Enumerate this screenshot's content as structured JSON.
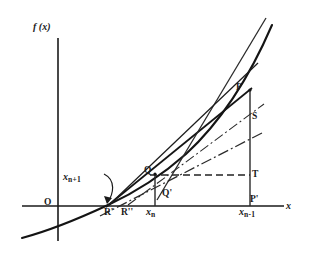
{
  "figure": {
    "type": "mathematical-diagram",
    "axes": {
      "y_axis_label": "f (x)",
      "x_axis_label": "x",
      "origin_label": "O"
    },
    "colors": {
      "ink": "#1a1a1a",
      "background": "#ffffff",
      "curve": "#141414",
      "construction": "#3a3a3a"
    },
    "point_labels": [
      {
        "id": "P",
        "text": "P",
        "x": 236,
        "y": 83
      },
      {
        "id": "S",
        "text": "S",
        "x": 252,
        "y": 112
      },
      {
        "id": "T",
        "text": "T",
        "x": 252,
        "y": 170
      },
      {
        "id": "Pp",
        "text": "P'",
        "x": 250,
        "y": 195
      },
      {
        "id": "Q",
        "text": "Q",
        "x": 144,
        "y": 168
      },
      {
        "id": "Qp",
        "text": "Q'",
        "x": 162,
        "y": 190
      },
      {
        "id": "Rp",
        "text": "R'",
        "x": 105,
        "y": 208
      },
      {
        "id": "Rpp",
        "text": "R''",
        "x": 122,
        "y": 208
      }
    ],
    "axis_values": [
      {
        "id": "xn",
        "base": "x",
        "sub": "n",
        "x": 147,
        "y": 207
      },
      {
        "id": "xnm1",
        "base": "x",
        "sub": "n-1",
        "x": 240,
        "y": 207
      }
    ],
    "annotation": {
      "id": "xnp1",
      "base": "x",
      "sub": "n+1",
      "x": 63,
      "y": 172,
      "note": "curved arrow pointing to R'"
    },
    "geometry": {
      "x_axis_y": 206,
      "y_axis_x": 58,
      "curve_root_x": 108,
      "xn": 155,
      "xnm1": 250,
      "P": [
        250,
        90
      ],
      "S": [
        250,
        118
      ],
      "T": [
        250,
        175
      ],
      "Q": [
        155,
        175
      ],
      "Qprime": [
        155,
        196
      ]
    }
  }
}
